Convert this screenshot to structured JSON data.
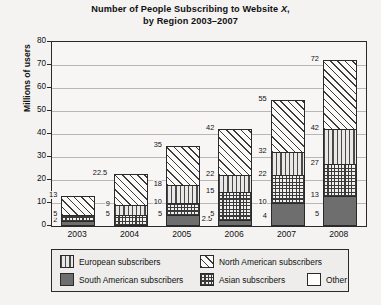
{
  "title": {
    "line1_pre": "Number of People Subscribing to Website ",
    "line1_italic": "X",
    "line1_post": ",",
    "line2": "by Region 2003–2007"
  },
  "axes": {
    "y_label": "Millions of users",
    "y_ticks": [
      0,
      10,
      20,
      30,
      40,
      50,
      60,
      70,
      80
    ],
    "y_min": 0,
    "y_max": 80,
    "x_ticks": [
      "2003",
      "2004",
      "2005",
      "2006",
      "2007",
      "2008"
    ]
  },
  "legend": {
    "items": [
      {
        "label": "European subscribers",
        "swatch": "vertical-stripe-swatch",
        "color": "#e9e8e6"
      },
      {
        "label": "North American subscribers",
        "swatch": "diagonal-hatch-swatch",
        "color": "#fbfaf8"
      },
      {
        "label": "South American subscribers",
        "swatch": "solid-gray-swatch",
        "color": "#6e6e6e"
      },
      {
        "label": "Asian subscribers",
        "swatch": "grid-hatch-swatch",
        "color": "#f0efed"
      },
      {
        "label": "Other",
        "swatch": "white-swatch",
        "color": "#fdfdfc"
      }
    ]
  },
  "chart_data": {
    "type": "bar",
    "subtype": "stacked",
    "title": "Number of People Subscribing to Website X, by Region 2003–2007",
    "xlabel": "",
    "ylabel": "Millions of users",
    "ylim": [
      0,
      80
    ],
    "ytick_step": 10,
    "grid": true,
    "legend_position": "bottom",
    "categories": [
      "2003",
      "2004",
      "2005",
      "2006",
      "2007",
      "2008"
    ],
    "series": [
      {
        "name": "South American subscribers",
        "values": [
          2,
          2,
          5,
          2.5,
          4,
          5
        ]
      },
      {
        "name": "Asian subscribers",
        "values": [
          3,
          3,
          5,
          2.5,
          6,
          8
        ]
      },
      {
        "name": "European subscribers",
        "values": [
          0,
          4,
          8,
          10,
          12,
          14
        ]
      },
      {
        "name": "North American subscribers",
        "values": [
          8,
          9,
          8,
          7,
          10,
          15
        ]
      },
      {
        "name": "Other",
        "values": [
          0,
          4.5,
          17,
          20,
          23,
          30
        ]
      }
    ],
    "cumulative_labels": [
      {
        "category": "2003",
        "values": [
          2,
          5,
          13
        ]
      },
      {
        "category": "2004",
        "values": [
          5,
          9,
          22.5
        ]
      },
      {
        "category": "2005",
        "values": [
          5,
          10,
          18,
          35
        ]
      },
      {
        "category": "2006",
        "values": [
          2.5,
          5,
          15,
          22,
          42
        ]
      },
      {
        "category": "2007",
        "values": [
          4,
          10,
          22,
          32,
          55
        ]
      },
      {
        "category": "2008",
        "values": [
          5,
          13,
          27,
          42,
          72
        ]
      }
    ],
    "totals": [
      13,
      22.5,
      35,
      42,
      55,
      72
    ]
  },
  "bars": [
    {
      "year": "2003",
      "segments": [
        {
          "series": "South American subscribers",
          "pattern": "p-samerica",
          "from": 0,
          "to": 2
        },
        {
          "series": "Asian subscribers",
          "pattern": "p-asia",
          "from": 2,
          "to": 5
        },
        {
          "series": "North American subscribers",
          "pattern": "p-namerica",
          "from": 5,
          "to": 13
        }
      ],
      "labels": [
        {
          "text": "2",
          "value": 2,
          "side": "left"
        },
        {
          "text": "5",
          "value": 5,
          "side": "left"
        },
        {
          "text": "13",
          "value": 13,
          "side": "left"
        }
      ]
    },
    {
      "year": "2004",
      "segments": [
        {
          "series": "Asian subscribers",
          "pattern": "p-asia",
          "from": 0,
          "to": 5
        },
        {
          "series": "European subscribers",
          "pattern": "p-europe",
          "from": 5,
          "to": 9
        },
        {
          "series": "North American subscribers",
          "pattern": "p-namerica",
          "from": 9,
          "to": 22.5
        }
      ],
      "labels": [
        {
          "text": "5",
          "value": 5,
          "side": "left"
        },
        {
          "text": "9",
          "value": 9,
          "side": "left"
        },
        {
          "text": "22.5",
          "value": 22.5,
          "side": "left"
        }
      ]
    },
    {
      "year": "2005",
      "segments": [
        {
          "series": "South American subscribers",
          "pattern": "p-samerica",
          "from": 0,
          "to": 5
        },
        {
          "series": "Asian subscribers",
          "pattern": "p-asia",
          "from": 5,
          "to": 10
        },
        {
          "series": "European subscribers",
          "pattern": "p-europe",
          "from": 10,
          "to": 18
        },
        {
          "series": "North American subscribers",
          "pattern": "p-namerica",
          "from": 18,
          "to": 35
        }
      ],
      "labels": [
        {
          "text": "5",
          "value": 5,
          "side": "left"
        },
        {
          "text": "10",
          "value": 10,
          "side": "left"
        },
        {
          "text": "18",
          "value": 18,
          "side": "left"
        },
        {
          "text": "35",
          "value": 35,
          "side": "left"
        }
      ]
    },
    {
      "year": "2006",
      "segments": [
        {
          "series": "South American subscribers",
          "pattern": "p-samerica",
          "from": 0,
          "to": 2.5
        },
        {
          "series": "Asian subscribers",
          "pattern": "p-asia",
          "from": 2.5,
          "to": 15
        },
        {
          "series": "European subscribers",
          "pattern": "p-europe",
          "from": 15,
          "to": 22
        },
        {
          "series": "North American subscribers",
          "pattern": "p-namerica",
          "from": 22,
          "to": 42
        }
      ],
      "labels": [
        {
          "text": "2.5",
          "value": 2.5,
          "side": "left"
        },
        {
          "text": "5",
          "value": 5,
          "side": "left"
        },
        {
          "text": "15",
          "value": 15,
          "side": "left"
        },
        {
          "text": "22",
          "value": 22,
          "side": "left"
        },
        {
          "text": "42",
          "value": 42,
          "side": "left"
        }
      ]
    },
    {
      "year": "2007",
      "segments": [
        {
          "series": "South American subscribers",
          "pattern": "p-samerica",
          "from": 0,
          "to": 10
        },
        {
          "series": "Asian subscribers",
          "pattern": "p-asia",
          "from": 10,
          "to": 22
        },
        {
          "series": "European subscribers",
          "pattern": "p-europe",
          "from": 22,
          "to": 32
        },
        {
          "series": "North American subscribers",
          "pattern": "p-namerica",
          "from": 32,
          "to": 55
        }
      ],
      "labels": [
        {
          "text": "4",
          "value": 4,
          "side": "left"
        },
        {
          "text": "10",
          "value": 10,
          "side": "left"
        },
        {
          "text": "22",
          "value": 22,
          "side": "left"
        },
        {
          "text": "32",
          "value": 32,
          "side": "left"
        },
        {
          "text": "55",
          "value": 55,
          "side": "left"
        }
      ]
    },
    {
      "year": "2008",
      "segments": [
        {
          "series": "South American subscribers",
          "pattern": "p-samerica",
          "from": 0,
          "to": 13
        },
        {
          "series": "Asian subscribers",
          "pattern": "p-asia",
          "from": 13,
          "to": 27
        },
        {
          "series": "European subscribers",
          "pattern": "p-europe",
          "from": 27,
          "to": 42
        },
        {
          "series": "North American subscribers",
          "pattern": "p-namerica",
          "from": 42,
          "to": 72
        }
      ],
      "labels": [
        {
          "text": "5",
          "value": 5,
          "side": "left"
        },
        {
          "text": "13",
          "value": 13,
          "side": "left"
        },
        {
          "text": "27",
          "value": 27,
          "side": "left"
        },
        {
          "text": "42",
          "value": 42,
          "side": "left"
        },
        {
          "text": "72",
          "value": 72,
          "side": "left"
        }
      ]
    }
  ]
}
